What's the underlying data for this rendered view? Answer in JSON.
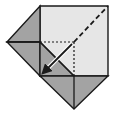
{
  "diagram": {
    "type": "origami-fold-step",
    "colors": {
      "background": "#ffffff",
      "paper_light": "#e6e6e6",
      "paper_dark": "#a3a3a3",
      "line": "#1a1a1a"
    },
    "shapes": {
      "square_light": "40,6 108,6 108,76 40,76",
      "left_upper_flap": "7,42 40,6 40,42",
      "left_lower_flap": "7,42 40,42 40,76",
      "inner_dark_triangle": "40,42 40,76 74,76",
      "bottom_flap": "40,76 108,76 74,109"
    },
    "lines": {
      "valley_fold_diagonal": {
        "x1": 74,
        "y1": 42,
        "x2": 108,
        "y2": 6,
        "style": "dashed"
      },
      "hidden_edge_horizontal": {
        "x1": 40,
        "y1": 42,
        "x2": 74,
        "y2": 42,
        "style": "dotted"
      },
      "hidden_edge_vertical": {
        "x1": 74,
        "y1": 42,
        "x2": 74,
        "y2": 76,
        "style": "dotted"
      },
      "crease_diagonal": {
        "x1": 40,
        "y1": 42,
        "x2": 74,
        "y2": 76,
        "style": "solid"
      },
      "bottom_flap_center": {
        "x1": 74,
        "y1": 76,
        "x2": 74,
        "y2": 109,
        "style": "solid"
      },
      "left_flap_divider": {
        "x1": 7,
        "y1": 42,
        "x2": 40,
        "y2": 42,
        "style": "solid"
      }
    },
    "arrow": {
      "label": "fold-direction",
      "x1": 72,
      "y1": 44,
      "x2": 45,
      "y2": 71
    }
  }
}
